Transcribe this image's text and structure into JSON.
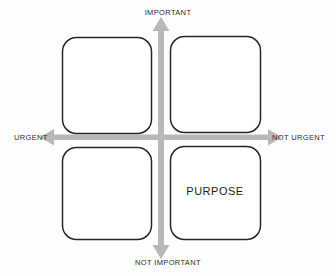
{
  "diagram": {
    "type": "2x2-matrix",
    "background_color": "#fefefe",
    "axes": {
      "vertical": {
        "top_label": "IMPORTANT",
        "bottom_label": "NOT IMPORTANT",
        "color": "#b3b3b3",
        "double_headed": true
      },
      "horizontal": {
        "left_label": "URGENT",
        "right_label": "NOT URGENT",
        "color": "#b3b3b3",
        "double_headed": true
      }
    },
    "box_style": {
      "stroke_color": "#262626",
      "fill_color": "#ffffff",
      "stroke_width": "1.5",
      "corner_radius": "14"
    },
    "quadrants": [
      {
        "position": "top-left",
        "meaning": "urgent-important",
        "label": ""
      },
      {
        "position": "top-right",
        "meaning": "not-urgent-important",
        "label": ""
      },
      {
        "position": "bottom-left",
        "meaning": "urgent-not-important",
        "label": ""
      },
      {
        "position": "bottom-right",
        "meaning": "not-urgent-not-important",
        "label": "PURPOSE"
      }
    ]
  }
}
